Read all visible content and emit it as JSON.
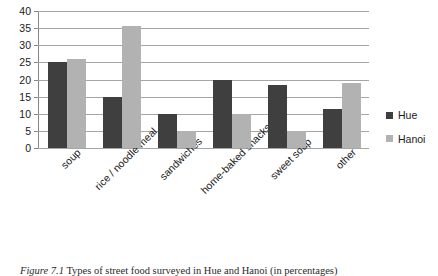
{
  "figure": {
    "number": "Figure 7.1",
    "caption": "Types of street food surveyed in Hue and Hanoi (in percentages)"
  },
  "legend": {
    "position": "right",
    "entries": [
      {
        "label": "Hue",
        "color": "#3f3f3f"
      },
      {
        "label": "Hanoi",
        "color": "#b2b2b2"
      }
    ]
  },
  "axis": {
    "y_ticks": [
      "40",
      "35",
      "30",
      "25",
      "20",
      "15",
      "10",
      "5",
      "0"
    ]
  },
  "chart_data": {
    "type": "bar",
    "title": "",
    "subtitle": "",
    "xlabel": "",
    "ylabel": "",
    "ylim": [
      0,
      40
    ],
    "ytick_step": 5,
    "grid": true,
    "legend_position": "right",
    "categories": [
      "soup",
      "rice / noodle meal",
      "sandwiches",
      "home-baked snacks",
      "sweet soup",
      "other"
    ],
    "series": [
      {
        "name": "Hue",
        "color": "#3f3f3f",
        "values": [
          25,
          15,
          10,
          20,
          18.5,
          11.5
        ]
      },
      {
        "name": "Hanoi",
        "color": "#b2b2b2",
        "values": [
          26,
          35.5,
          5,
          10,
          5,
          19
        ]
      }
    ]
  }
}
